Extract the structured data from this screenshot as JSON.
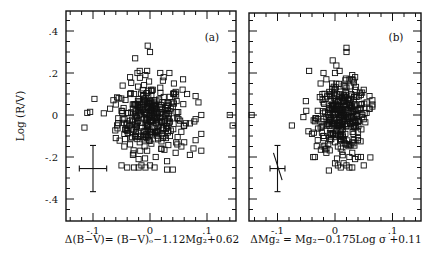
{
  "chart_data": [
    {
      "type": "scatter",
      "panel_label": "(a)",
      "xlabel": "Δ(B−V)= (B−V)ₒ−1.12Mg₂+0.62",
      "ylabel": "Log (R/V)",
      "xlim": [
        -0.15,
        0.15
      ],
      "ylim": [
        -0.5,
        0.5
      ],
      "xticks": [
        -0.1,
        0,
        0.1
      ],
      "xtick_labels": [
        "-.1",
        "0",
        ".1"
      ],
      "yticks": [
        0.4,
        0.2,
        0,
        -0.2,
        -0.4
      ],
      "ytick_labels": [
        ".4",
        ".2",
        "0",
        "-.2",
        "-.4"
      ],
      "grid": false,
      "marker": "open-square",
      "error_bar": {
        "x": -0.1,
        "y": -0.255,
        "xerr": 0.024,
        "yerr": 0.11
      },
      "points_note": "approximate; ~400 points concentrated near (0, 0)",
      "x": [
        -0.02,
        -0.01,
        0.0,
        0.01,
        -0.03,
        0.02,
        0.03,
        -0.04,
        0.04,
        -0.05,
        0.05,
        -0.015,
        0.015,
        -0.025,
        0.025,
        0.0,
        -0.008,
        0.008,
        0.012,
        -0.012,
        -0.06,
        0.06,
        -0.07,
        0.07,
        -0.035,
        0.035,
        -0.045,
        0.045,
        -0.055,
        0.055,
        0.002,
        -0.002,
        0.018,
        -0.018,
        0.028,
        -0.028,
        0.038,
        -0.038,
        0.048,
        -0.048,
        -0.035,
        -0.004,
        0.0,
        -0.026,
        -0.022,
        -0.018,
        -0.008,
        -0.005,
        0.018,
        0.024,
        0.034,
        0.042,
        0.058,
        0.065,
        0.08,
        0.085,
        0.09,
        0.08,
        -0.11,
        -0.105,
        -0.115,
        -0.045,
        -0.035,
        0.14,
        0.145,
        0.08,
        0.09,
        0.04,
        0.055,
        0.09,
        -0.05,
        -0.04,
        -0.028,
        -0.02,
        -0.015,
        -0.008,
        0.0,
        0.008,
        0.03,
        -0.06,
        -0.045,
        -0.03,
        -0.02,
        -0.005,
        0.01,
        0.02,
        0.03,
        0.045,
        0.06,
        0.07
      ],
      "y": [
        0.0,
        -0.02,
        0.02,
        -0.01,
        0.03,
        -0.03,
        0.01,
        -0.04,
        0.04,
        0.02,
        -0.02,
        0.05,
        -0.05,
        -0.06,
        0.06,
        -0.08,
        0.08,
        0.07,
        -0.07,
        0.09,
        0.05,
        -0.05,
        0.03,
        -0.04,
        0.1,
        -0.1,
        -0.09,
        0.11,
        0.08,
        -0.08,
        0.12,
        -0.12,
        0.13,
        -0.13,
        -0.11,
        0.1,
        0.06,
        -0.06,
        -0.14,
        0.14,
        0.18,
        0.33,
        0.3,
        0.27,
        0.2,
        0.21,
        0.19,
        0.21,
        0.2,
        0.18,
        0.2,
        0.15,
        0.17,
        0.1,
        0.09,
        0.06,
        0.0,
        -0.02,
        0.01,
        0.015,
        -0.06,
        -0.02,
        -0.14,
        0.0,
        -0.05,
        -0.12,
        -0.17,
        -0.26,
        -0.15,
        -0.09,
        -0.24,
        -0.25,
        -0.25,
        -0.25,
        -0.24,
        -0.25,
        -0.24,
        -0.25,
        -0.26,
        -0.11,
        -0.15,
        -0.19,
        -0.21,
        -0.17,
        -0.2,
        -0.16,
        -0.22,
        -0.18,
        -0.13,
        -0.19
      ]
    },
    {
      "type": "scatter",
      "panel_label": "(b)",
      "xlabel": "ΔMg₂ = Mg₂−0.175Log σ +0.11",
      "ylabel": "Log (R/V)",
      "xlim": [
        -0.15,
        0.15
      ],
      "ylim": [
        -0.5,
        0.5
      ],
      "xticks": [
        -0.1,
        0,
        0.1
      ],
      "xtick_labels": [
        "-.1",
        "0",
        ".1"
      ],
      "yticks": [
        0.4,
        0.2,
        0,
        -0.2,
        -0.4
      ],
      "ytick_labels": [
        "",
        "",
        "",
        "",
        ""
      ],
      "grid": false,
      "marker": "open-square",
      "error_bar": {
        "x": -0.1,
        "y": -0.255,
        "xerr": 0.013,
        "yerr": 0.11,
        "slanted_line": [
          [
            -0.107,
            -0.18
          ],
          [
            -0.092,
            -0.31
          ]
        ]
      },
      "points_note": "approximate; ~400 points concentrated near (0.01, 0)",
      "x": [
        0.0,
        0.01,
        0.02,
        -0.01,
        0.015,
        -0.005,
        0.025,
        0.005,
        -0.015,
        0.03,
        -0.02,
        0.035,
        0.012,
        0.008,
        -0.008,
        0.018,
        0.022,
        0.028,
        -0.025,
        0.04,
        -0.03,
        0.045,
        -0.035,
        0.05,
        0.0,
        0.01,
        0.02,
        0.03,
        -0.01,
        -0.02,
        0.005,
        0.015,
        0.025,
        -0.005,
        0.04,
        -0.015,
        0.035,
        0.045,
        0.055,
        0.06,
        0.02,
        0.02,
        -0.004,
        -0.045,
        0.008,
        0.0,
        -0.02,
        0.03,
        0.03,
        0.035,
        -0.015,
        -0.025,
        0.05,
        0.06,
        0.065,
        0.065,
        0.06,
        0.055,
        -0.145,
        -0.05,
        -0.075,
        -0.055,
        -0.03,
        -0.02,
        0.0,
        0.01,
        0.025,
        0.035,
        0.045,
        0.03,
        0.0,
        0.005,
        0.01,
        0.02,
        0.025,
        0.015,
        0.03,
        -0.02,
        -0.015,
        0.04,
        0.05,
        -0.04,
        -0.03,
        -0.035,
        0.04
      ],
      "y": [
        0.0,
        0.02,
        -0.02,
        0.03,
        -0.03,
        0.05,
        0.01,
        -0.05,
        -0.01,
        0.04,
        0.06,
        -0.04,
        0.08,
        -0.07,
        0.09,
        -0.09,
        0.07,
        0.1,
        -0.06,
        -0.08,
        0.02,
        0.03,
        -0.03,
        -0.02,
        0.12,
        -0.12,
        0.13,
        -0.13,
        0.11,
        -0.1,
        -0.15,
        0.14,
        -0.14,
        0.15,
        -0.11,
        -0.16,
        0.12,
        0.05,
        0.06,
        0.03,
        0.32,
        0.3,
        0.26,
        0.21,
        0.21,
        0.2,
        0.2,
        0.19,
        0.17,
        0.18,
        0.17,
        0.15,
        0.12,
        0.09,
        0.07,
        0.05,
        0.03,
        0.01,
        0.0,
        0.02,
        -0.05,
        -0.01,
        -0.02,
        -0.05,
        -0.13,
        -0.16,
        -0.2,
        -0.21,
        -0.2,
        -0.18,
        -0.23,
        -0.24,
        -0.25,
        -0.24,
        -0.25,
        -0.23,
        -0.25,
        -0.15,
        -0.18,
        -0.2,
        -0.24,
        -0.09,
        -0.12,
        -0.2,
        -0.12
      ]
    }
  ]
}
